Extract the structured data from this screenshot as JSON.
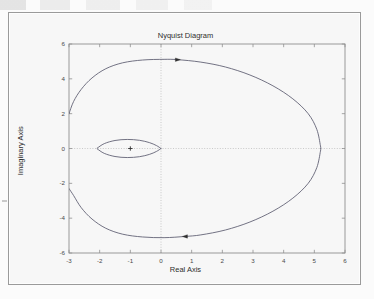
{
  "figure": {
    "title": "Nyquist Diagram"
  },
  "chart_data": {
    "type": "line",
    "title": "Nyquist Diagram",
    "xlabel": "Real Axis",
    "ylabel": "Imaginary Axis",
    "xlim": [
      -3,
      6
    ],
    "ylim": [
      -6,
      6
    ],
    "xticks": [
      "-3",
      "-2",
      "-1",
      "0",
      "1",
      "2",
      "3",
      "4",
      "5",
      "6"
    ],
    "yticks": [
      "6",
      "4",
      "2",
      "0",
      "-2",
      "-4",
      "-6"
    ],
    "xtick_values": [
      -3,
      -2,
      -1,
      0,
      1,
      2,
      3,
      4,
      5,
      6
    ],
    "ytick_values": [
      6,
      4,
      2,
      0,
      -2,
      -4,
      -6
    ],
    "grid": false,
    "zero_lines": true,
    "legend": "none",
    "line_color": "#5a5a6e",
    "marker_color": "#303030",
    "axis_color": "#8f8f8f",
    "zero_line_color": "#b4b4b4",
    "series": [
      {
        "name": "Nyquist contour (outer lobe, upper half)",
        "comment": "Large lobe from left edge (-3, 2.0) sweeping up over the top, out to the right extreme near 5.2, and back down.",
        "points": [
          [
            -3.0,
            2.0
          ],
          [
            -2.85,
            2.7
          ],
          [
            -2.6,
            3.4
          ],
          [
            -2.25,
            4.05
          ],
          [
            -1.8,
            4.58
          ],
          [
            -1.25,
            4.92
          ],
          [
            -0.6,
            5.08
          ],
          [
            0.1,
            5.12
          ],
          [
            0.55,
            5.1
          ],
          [
            1.3,
            4.96
          ],
          [
            2.1,
            4.68
          ],
          [
            2.9,
            4.22
          ],
          [
            3.65,
            3.6
          ],
          [
            4.3,
            2.85
          ],
          [
            4.8,
            2.0
          ],
          [
            5.08,
            1.1
          ],
          [
            5.2,
            0.15
          ],
          [
            5.2,
            0.0
          ]
        ]
      },
      {
        "name": "Nyquist contour (outer lobe, lower half)",
        "comment": "Mirror image of the upper lobe below the real axis.",
        "points": [
          [
            5.2,
            0.0
          ],
          [
            5.2,
            -0.15
          ],
          [
            5.08,
            -1.1
          ],
          [
            4.8,
            -2.0
          ],
          [
            4.3,
            -2.85
          ],
          [
            3.65,
            -3.6
          ],
          [
            2.9,
            -4.22
          ],
          [
            2.1,
            -4.68
          ],
          [
            1.3,
            -4.96
          ],
          [
            0.78,
            -5.05
          ],
          [
            0.1,
            -5.12
          ],
          [
            -0.6,
            -5.08
          ],
          [
            -1.25,
            -4.92
          ],
          [
            -1.8,
            -4.58
          ],
          [
            -2.25,
            -4.05
          ],
          [
            -2.6,
            -3.4
          ],
          [
            -2.85,
            -2.7
          ],
          [
            -3.0,
            -2.3
          ]
        ]
      },
      {
        "name": "Inner loop (upper half)",
        "comment": "Small lens-shaped loop from the crossover near (-2.05, 0.05) to the origin.",
        "points": [
          [
            -2.08,
            0.02
          ],
          [
            -1.85,
            0.28
          ],
          [
            -1.5,
            0.46
          ],
          [
            -1.1,
            0.52
          ],
          [
            -0.7,
            0.47
          ],
          [
            -0.38,
            0.34
          ],
          [
            -0.15,
            0.17
          ],
          [
            0.0,
            0.0
          ]
        ]
      },
      {
        "name": "Inner loop (lower half)",
        "comment": "Lower arc of the small lens loop back to the crossover.",
        "points": [
          [
            0.0,
            0.0
          ],
          [
            -0.15,
            -0.17
          ],
          [
            -0.38,
            -0.34
          ],
          [
            -0.7,
            -0.47
          ],
          [
            -1.1,
            -0.52
          ],
          [
            -1.5,
            -0.46
          ],
          [
            -1.85,
            -0.28
          ],
          [
            -2.08,
            -0.02
          ]
        ]
      }
    ],
    "markers": [
      {
        "name": "critical-point-marker",
        "glyph": "+",
        "x": -1.0,
        "y": 0.0
      }
    ],
    "annotations": [
      {
        "name": "direction-arrow-top",
        "shape": "triangle-right",
        "x": 0.55,
        "y": 5.1,
        "direction": "right"
      },
      {
        "name": "direction-arrow-bottom",
        "shape": "triangle-left",
        "x": 0.78,
        "y": -5.05,
        "direction": "left"
      }
    ]
  }
}
